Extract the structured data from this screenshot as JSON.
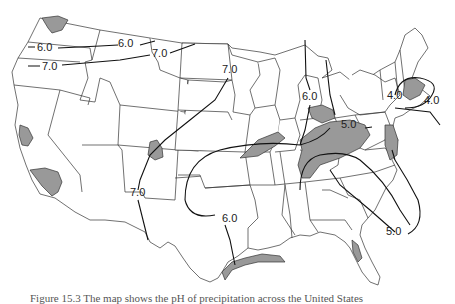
{
  "map": {
    "title": "pH of precipitation, contiguous United States",
    "shade_color": "#999999",
    "line_color": "#111111",
    "isopleth_labels": [
      {
        "id": "nw-6",
        "text": "6.0",
        "x": 11,
        "y": 51
      },
      {
        "id": "mt-6",
        "text": "6.0",
        "x": 118,
        "y": 47
      },
      {
        "id": "mt-7",
        "text": "7.0",
        "x": 152,
        "y": 55
      },
      {
        "id": "or-7",
        "text": "7.0",
        "x": 43,
        "y": 69
      },
      {
        "id": "dk-7",
        "text": "7.0",
        "x": 223,
        "y": 72
      },
      {
        "id": "nm-7",
        "text": "7.0",
        "x": 130,
        "y": 195
      },
      {
        "id": "tx-6",
        "text": "6.0",
        "x": 222,
        "y": 221
      },
      {
        "id": "mi-6",
        "text": "6.0",
        "x": 302,
        "y": 99
      },
      {
        "id": "oh-5",
        "text": "5.0",
        "x": 341,
        "y": 127
      },
      {
        "id": "ne-4a",
        "text": "4.0",
        "x": 387,
        "y": 98
      },
      {
        "id": "ne-4b",
        "text": "4.0",
        "x": 424,
        "y": 103
      },
      {
        "id": "se-5",
        "text": "5.0",
        "x": 386,
        "y": 234
      }
    ]
  },
  "caption": {
    "text": "Figure 15.3  The map shows the pH of precipitation across the United States"
  }
}
